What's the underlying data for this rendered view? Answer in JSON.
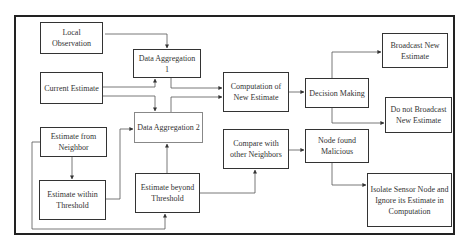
{
  "nodes": {
    "local_observation": "Local Observation",
    "data_aggregation_1": "Data Aggregation 1",
    "current_estimate": "Current Estimate",
    "data_aggregation_2": "Data Aggregation 2",
    "estimate_from_neighbor": "Estimate from Neighbor",
    "estimate_within_threshold": "Estimate within Threshold",
    "estimate_beyond_threshold": "Estimate beyond Threshold",
    "computation_new_estimate": "Computation of New Estimate",
    "compare_other_neighbors": "Compare with other Neighbors",
    "decision_making": "Decision Making",
    "node_found_malicious": "Node found Malicious",
    "broadcast_new_estimate": "Broadcast New Estimate",
    "do_not_broadcast": "Do not Broadcast New Estimate",
    "isolate_sensor_node": "Isolate Sensor Node and Ignore its Estimate in Computation"
  },
  "edges": [
    [
      "local_observation",
      "data_aggregation_1"
    ],
    [
      "current_estimate",
      "data_aggregation_1"
    ],
    [
      "current_estimate",
      "data_aggregation_2"
    ],
    [
      "estimate_from_neighbor",
      "estimate_within_threshold"
    ],
    [
      "estimate_from_neighbor",
      "estimate_beyond_threshold"
    ],
    [
      "estimate_within_threshold",
      "data_aggregation_2"
    ],
    [
      "estimate_beyond_threshold",
      "data_aggregation_2"
    ],
    [
      "estimate_beyond_threshold",
      "compare_other_neighbors"
    ],
    [
      "data_aggregation_1",
      "computation_new_estimate"
    ],
    [
      "data_aggregation_2",
      "computation_new_estimate"
    ],
    [
      "computation_new_estimate",
      "decision_making"
    ],
    [
      "decision_making",
      "broadcast_new_estimate"
    ],
    [
      "decision_making",
      "do_not_broadcast"
    ],
    [
      "compare_other_neighbors",
      "node_found_malicious"
    ],
    [
      "node_found_malicious",
      "isolate_sensor_node"
    ]
  ]
}
